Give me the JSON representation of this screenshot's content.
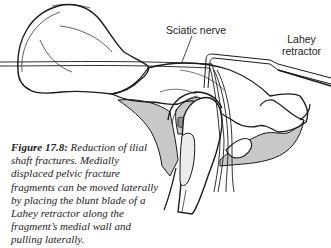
{
  "figure": {
    "labels": {
      "sciatic_nerve": "Sciatic nerve",
      "lahey_line1": "Lahey",
      "lahey_line2": "retractor"
    },
    "caption": {
      "number": "Figure 17.8:",
      "text": " Reduction of ilial shaft fractures. Medially displaced pelvic fracture fragments can be moved laterally by placing the blunt blade of a Lahey retractor along the fragment’s medial wall and pulling laterally."
    },
    "colors": {
      "line": "#1a1a1a",
      "bone_fill": "#ffffff",
      "shade": "#c8c8c8",
      "dark_shade": "#8f8f8f"
    }
  }
}
